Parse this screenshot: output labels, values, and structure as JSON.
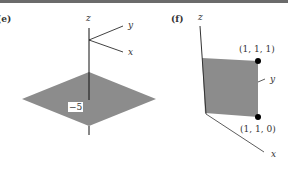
{
  "figure": {
    "panels": [
      {
        "id": "e",
        "label": "(e)",
        "axes": {
          "z": "z",
          "y": "y",
          "x": "x"
        },
        "plane_label": "−5",
        "plane_color": "#8c8c8c",
        "description": "Horizontal plane z = −5"
      },
      {
        "id": "f",
        "label": "(f)",
        "axes": {
          "z": "z",
          "y": "y",
          "x": "x"
        },
        "points": [
          {
            "label": "(1, 1, 1)"
          },
          {
            "label": "(1, 1, 0)"
          }
        ],
        "plane_color": "#8c8c8c",
        "description": "Vertical plane through points (1,1,1) and (1,1,0)"
      }
    ]
  }
}
